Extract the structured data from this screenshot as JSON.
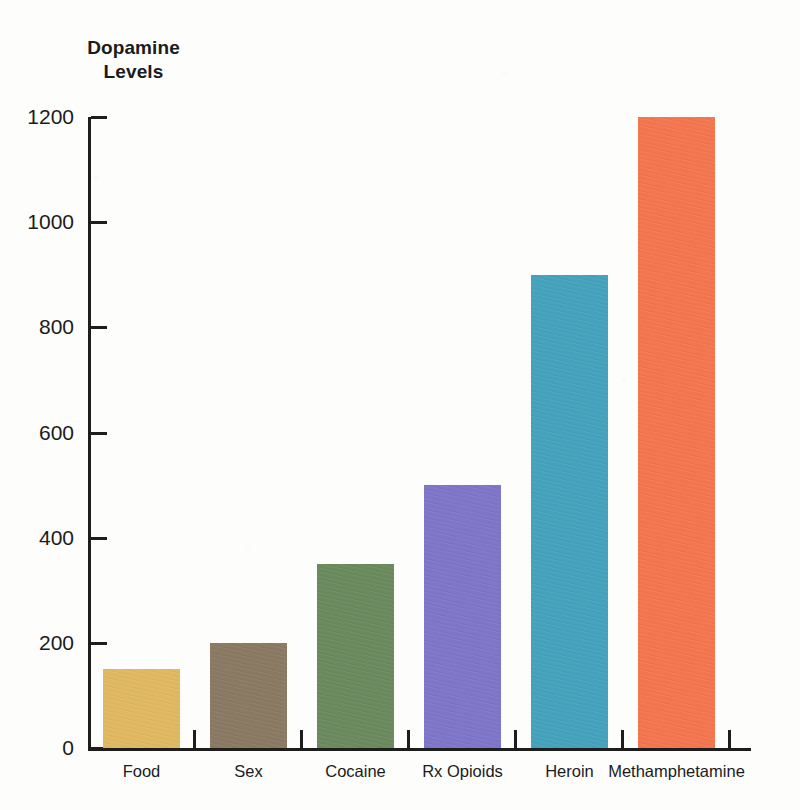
{
  "chart_data": {
    "type": "bar",
    "title": "Dopamine Levels",
    "title_lines": [
      "Dopamine",
      "Levels"
    ],
    "xlabel": "",
    "ylabel": "Dopamine Levels",
    "categories": [
      "Food",
      "Sex",
      "Cocaine",
      "Rx Opioids",
      "Heroin",
      "Methamphetamine"
    ],
    "values": [
      150,
      200,
      350,
      500,
      900,
      1200
    ],
    "series": [
      {
        "name": "Dopamine Levels",
        "values": [
          150,
          200,
          350,
          500,
          900,
          1200
        ]
      }
    ],
    "bar_colors": [
      "#e0b861",
      "#8b7a63",
      "#6b8a5e",
      "#7f75c9",
      "#45a2bd",
      "#f4764f"
    ],
    "ylim": [
      0,
      1200
    ],
    "y_ticks": [
      0,
      200,
      400,
      600,
      800,
      1000,
      1200
    ],
    "y_tick_labels": [
      "0",
      "200",
      "400",
      "600",
      "800",
      "1000",
      "1200"
    ],
    "grid": false,
    "legend": "none",
    "axis_color": "#1d1d1d",
    "background_color": "#fdfdfc"
  },
  "bars": [
    {
      "label": "Food",
      "value": 150,
      "color": "#e0b861"
    },
    {
      "label": "Sex",
      "value": 200,
      "color": "#8b7a63"
    },
    {
      "label": "Cocaine",
      "value": 350,
      "color": "#6b8a5e"
    },
    {
      "label": "Rx Opioids",
      "value": 500,
      "color": "#7f75c9"
    },
    {
      "label": "Heroin",
      "value": 900,
      "color": "#45a2bd"
    },
    {
      "label": "Methamphetamine",
      "value": 1200,
      "color": "#f4764f"
    }
  ]
}
